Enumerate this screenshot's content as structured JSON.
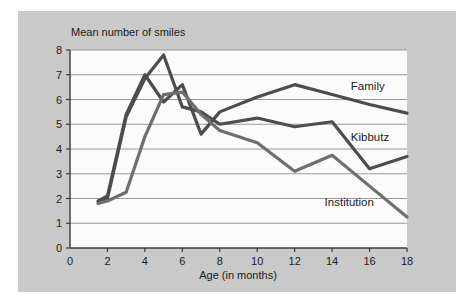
{
  "figure": {
    "panel_color": "#c9c9c9",
    "plot_background": "#fbfbfb",
    "grid_color": "#8f8f8f",
    "axis_color": "#3a3a3a",
    "page_background": "#ffffff"
  },
  "chart_data": {
    "type": "line",
    "title": "",
    "xlabel": "Age (in months)",
    "ylabel": "Mean number of smiles",
    "xlim": [
      0,
      18
    ],
    "ylim": [
      0,
      8
    ],
    "xticks": [
      0,
      2,
      4,
      6,
      8,
      10,
      12,
      14,
      16,
      18
    ],
    "xtick_labels": [
      "0",
      "2",
      "4",
      "6",
      "8",
      "10",
      "12",
      "14",
      "16",
      "18"
    ],
    "yticks": [
      0,
      1,
      2,
      3,
      4,
      5,
      6,
      7,
      8
    ],
    "ytick_labels": [
      "0",
      "1",
      "2",
      "3",
      "4",
      "5",
      "6",
      "7",
      "8"
    ],
    "grid": "horizontal",
    "legend": "inline-labels-right",
    "series": [
      {
        "name": "Family",
        "color": "#4d4d4d",
        "label_x": 15.0,
        "label_y": 6.55,
        "x": [
          1.5,
          2,
          3,
          4,
          5,
          6,
          7,
          8,
          10,
          12,
          14,
          16,
          18
        ],
        "y": [
          1.9,
          2.1,
          5.4,
          7.0,
          5.9,
          6.6,
          4.6,
          5.5,
          6.1,
          6.6,
          6.2,
          5.8,
          5.45
        ]
      },
      {
        "name": "Kibbutz",
        "color": "#4d4d4d",
        "label_x": 15.0,
        "label_y": 4.5,
        "x": [
          1.5,
          2,
          3,
          4,
          5,
          6,
          7,
          8,
          10,
          12,
          14,
          16,
          18
        ],
        "y": [
          1.85,
          2.0,
          5.3,
          6.85,
          7.8,
          5.7,
          5.5,
          5.0,
          5.25,
          4.9,
          5.1,
          3.2,
          3.7
        ]
      },
      {
        "name": "Institution",
        "color": "#6e6e6e",
        "label_x": 13.6,
        "label_y": 1.85,
        "x": [
          1.5,
          2,
          3,
          4,
          5,
          6,
          7,
          8,
          10,
          12,
          14,
          16,
          18
        ],
        "y": [
          1.8,
          1.9,
          2.25,
          4.5,
          6.2,
          6.3,
          5.4,
          4.75,
          4.25,
          3.1,
          3.75,
          2.5,
          1.25
        ]
      }
    ]
  }
}
